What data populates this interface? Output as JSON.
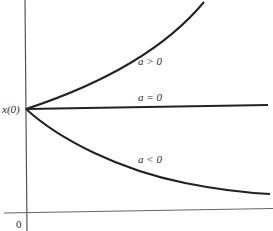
{
  "diagram": {
    "y_intercept_label": "x(0)",
    "origin_label": "0",
    "curves": [
      {
        "id": "growth",
        "label": "a > 0",
        "behavior": "exponential growth"
      },
      {
        "id": "constant",
        "label": "a = 0",
        "behavior": "constant"
      },
      {
        "id": "decay",
        "label": "a < 0",
        "behavior": "exponential decay"
      }
    ]
  },
  "colors": {
    "stroke": "#222222",
    "axis": "#555555",
    "text": "#2a2a2a"
  }
}
